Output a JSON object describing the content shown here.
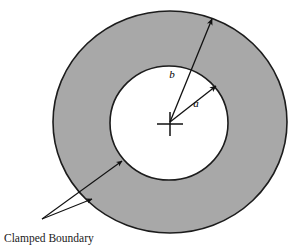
{
  "figure": {
    "type": "annular-plate-diagram",
    "background_color": "#ffffff",
    "annulus": {
      "fill_color": "#a8a8a8",
      "stroke_color": "#1c1c1c",
      "outer_radius_label": "b",
      "inner_radius_label": "a"
    },
    "inner_hole": {
      "fill_color": "#ffffff",
      "stroke_color": "#1c1c1c"
    },
    "labels": {
      "outer_radius": "b",
      "inner_radius": "a",
      "boundary_caption": "Clamped Boundary"
    },
    "geometry": {
      "center_x": 170,
      "center_y": 122,
      "outer_rx": 117,
      "outer_ry": 111,
      "inner_rx": 59,
      "inner_ry": 57,
      "outer_arrow_tip_x": 212,
      "outer_arrow_tip_y": 18,
      "inner_arrow_tip_x": 216,
      "inner_arrow_tip_y": 85,
      "leader_origin_x": 42,
      "leader_origin_y": 219,
      "leader_tip_inner_x": 122,
      "leader_tip_inner_y": 161,
      "leader_tip_outer_x": 92,
      "leader_tip_outer_y": 199
    }
  }
}
